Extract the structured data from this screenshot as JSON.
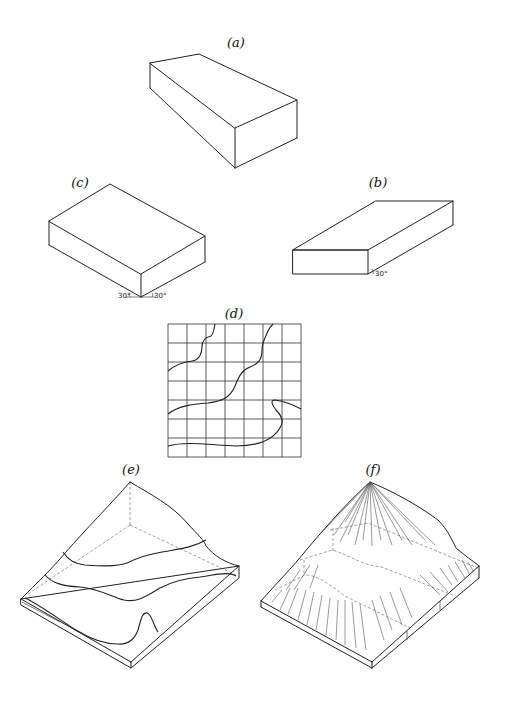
{
  "figure": {
    "panels": [
      {
        "id": "a",
        "label": "(a)",
        "description": "oblique/perspective rectangular block"
      },
      {
        "id": "b",
        "label": "(b)",
        "description": "oblique projection slab",
        "angle_label": "30°"
      },
      {
        "id": "c",
        "label": "(c)",
        "description": "isometric block",
        "angle_labels": [
          "30°",
          "30°"
        ]
      },
      {
        "id": "d",
        "label": "(d)",
        "description": "contour map on 7x7 square grid",
        "grid_cells": 7
      },
      {
        "id": "e",
        "label": "(e)",
        "description": "isometric block diagram of terrain with contour lines"
      },
      {
        "id": "f",
        "label": "(f)",
        "description": "isometric block diagram of terrain with hachure slope lines"
      }
    ]
  },
  "labels": {
    "a": "(a)",
    "b": "(b)",
    "c": "(c)",
    "d": "(d)",
    "e": "(e)",
    "f": "(f)",
    "c_angle_left": "30°",
    "c_angle_right": "30°",
    "b_angle": "30°"
  }
}
